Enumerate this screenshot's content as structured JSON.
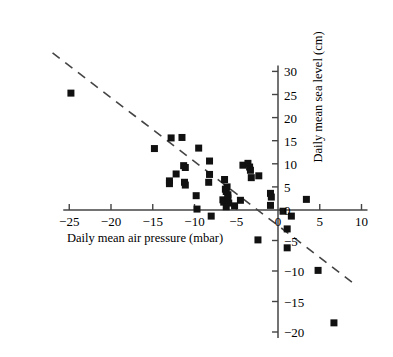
{
  "chart_data": {
    "type": "scatter",
    "title": "",
    "xlabel": "Daily mean air pressure (mbar)",
    "ylabel": "Daily mean sea level (cm)",
    "xlim": [
      -27,
      11
    ],
    "ylim": [
      -21,
      31
    ],
    "xticks": [
      -25,
      -20,
      -15,
      -10,
      -5,
      0,
      5,
      10
    ],
    "xtick_labels": [
      "−25",
      "−20",
      "−15",
      "−10",
      "−5",
      "0",
      "5",
      "10"
    ],
    "yticks": [
      -20,
      -15,
      -10,
      -5,
      0,
      5,
      10,
      15,
      20,
      25,
      30
    ],
    "ytick_labels": [
      "−20",
      "−15",
      "−10",
      "−5",
      "0",
      "5",
      "10",
      "15",
      "20",
      "25",
      "30"
    ],
    "grid": false,
    "legend": null,
    "marker": "square",
    "marker_color": "#111111",
    "marker_size_px": 7,
    "axis_color": "#444444",
    "axis_style": "crossed-spines-at-origin",
    "trendline": {
      "style": "dashed",
      "color": "#444444",
      "x_start": -27.0,
      "y_start": 34.0,
      "x_end": 9.5,
      "y_end": -12.5,
      "slope": -1.27,
      "intercept": -0.3
    },
    "points": [
      {
        "x": -24.8,
        "y": 25.3
      },
      {
        "x": -14.8,
        "y": 13.3
      },
      {
        "x": -12.8,
        "y": 15.6
      },
      {
        "x": -11.5,
        "y": 15.7
      },
      {
        "x": -9.5,
        "y": 13.4
      },
      {
        "x": -8.2,
        "y": 10.6
      },
      {
        "x": -11.3,
        "y": 9.6
      },
      {
        "x": -11.1,
        "y": 9.2
      },
      {
        "x": -12.2,
        "y": 7.8
      },
      {
        "x": -8.2,
        "y": 7.7
      },
      {
        "x": -13.0,
        "y": 6.3
      },
      {
        "x": -13.0,
        "y": 5.7
      },
      {
        "x": -11.2,
        "y": 6.0
      },
      {
        "x": -11.1,
        "y": 5.4
      },
      {
        "x": -8.3,
        "y": 6.0
      },
      {
        "x": -9.8,
        "y": 3.1
      },
      {
        "x": -9.7,
        "y": 0.2
      },
      {
        "x": -8.0,
        "y": -1.0
      },
      {
        "x": -6.6,
        "y": 2.2
      },
      {
        "x": -6.5,
        "y": 1.7
      },
      {
        "x": -6.2,
        "y": 0.7
      },
      {
        "x": -6.3,
        "y": 4.5
      },
      {
        "x": -6.2,
        "y": 4.0
      },
      {
        "x": -6.1,
        "y": 5.0
      },
      {
        "x": -6.0,
        "y": 3.3
      },
      {
        "x": -6.0,
        "y": 2.6
      },
      {
        "x": -5.9,
        "y": 1.5
      },
      {
        "x": -6.4,
        "y": 6.6
      },
      {
        "x": -4.2,
        "y": 9.7
      },
      {
        "x": -3.6,
        "y": 10.1
      },
      {
        "x": -3.4,
        "y": 9.3
      },
      {
        "x": -3.3,
        "y": 8.6
      },
      {
        "x": -3.2,
        "y": 7.0
      },
      {
        "x": -2.3,
        "y": 7.4
      },
      {
        "x": -4.5,
        "y": 2.1
      },
      {
        "x": -5.2,
        "y": 0.9
      },
      {
        "x": -0.9,
        "y": 3.6
      },
      {
        "x": -0.8,
        "y": 2.8
      },
      {
        "x": -0.9,
        "y": 1.0
      },
      {
        "x": 0.6,
        "y": -0.2
      },
      {
        "x": 1.6,
        "y": -1.0
      },
      {
        "x": 3.4,
        "y": 2.3
      },
      {
        "x": 1.1,
        "y": -3.1
      },
      {
        "x": 1.1,
        "y": -6.2
      },
      {
        "x": -2.4,
        "y": -4.9
      },
      {
        "x": 4.8,
        "y": -9.9
      },
      {
        "x": 6.7,
        "y": -18.5
      }
    ]
  },
  "axis_titles": {
    "x": "Daily mean air pressure (mbar)",
    "y": "Daily mean sea level (cm)"
  }
}
